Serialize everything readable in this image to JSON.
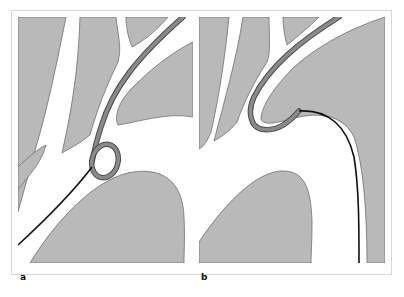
{
  "figure": {
    "panels": [
      {
        "id": "a",
        "label": "a",
        "description": "Catheter tip forming a loop within the vessel, guidewire entering from lower left"
      },
      {
        "id": "b",
        "label": "b",
        "description": "Catheter with hooked tip engaged in branch vessel, guidewire running down the right side"
      }
    ],
    "colors": {
      "tissue": "#b9b9b9",
      "tissue_outline": "#6e6e6e",
      "vessel_lumen": "#ffffff",
      "catheter": "#7a7a7a",
      "catheter_outline": "#4a4a4a",
      "guidewire": "#111111",
      "frame_border": "#d6d6d6"
    }
  }
}
